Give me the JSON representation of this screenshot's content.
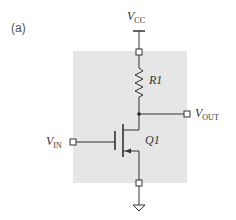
{
  "figure": {
    "panel_label": "(a)",
    "background_box_color": "#e6e6e6",
    "components": {
      "supply": {
        "symbol": "V",
        "subscript": "CC"
      },
      "resistor": {
        "label": "R1"
      },
      "transistor": {
        "label": "Q1",
        "type": "n-channel MOSFET"
      },
      "input": {
        "symbol": "V",
        "subscript": "IN"
      },
      "output": {
        "symbol": "V",
        "subscript": "OUT"
      },
      "ground": {
        "icon": "ground-icon"
      }
    }
  }
}
